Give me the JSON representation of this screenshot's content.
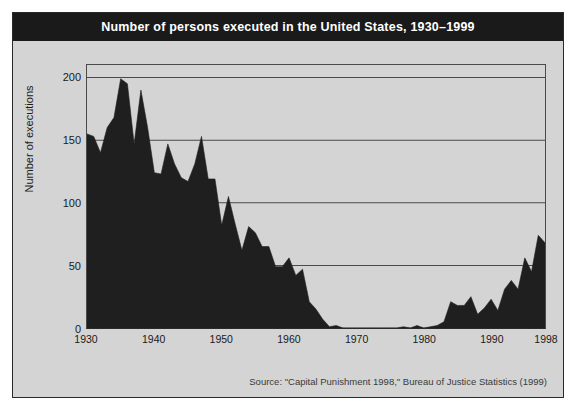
{
  "figure": {
    "title": "Number of persons executed in the United States, 1930–1999",
    "source": "Source: \"Capital Punishment 1998,\" Bureau of Justice Statistics (1999)",
    "background_color": "#d4d4d4",
    "title_bar_color": "#1a1a1a",
    "series_color": "#1f1f1f",
    "grid_color": "#4a4a4a"
  },
  "chart_data": {
    "type": "area",
    "title": "Number of persons executed in the United States, 1930–1999",
    "xlabel": "",
    "ylabel": "Number of executions",
    "xlim": [
      1930,
      1998
    ],
    "ylim": [
      0,
      210
    ],
    "yticks": [
      0,
      50,
      100,
      150,
      200
    ],
    "xticks": [
      1930,
      1940,
      1950,
      1960,
      1970,
      1980,
      1990,
      1998
    ],
    "grid": "horizontal",
    "legend": "none",
    "x": [
      1930,
      1931,
      1932,
      1933,
      1934,
      1935,
      1936,
      1937,
      1938,
      1939,
      1940,
      1941,
      1942,
      1943,
      1944,
      1945,
      1946,
      1947,
      1948,
      1949,
      1950,
      1951,
      1952,
      1953,
      1954,
      1955,
      1956,
      1957,
      1958,
      1959,
      1960,
      1961,
      1962,
      1963,
      1964,
      1965,
      1966,
      1967,
      1968,
      1969,
      1970,
      1971,
      1972,
      1973,
      1974,
      1975,
      1976,
      1977,
      1978,
      1979,
      1980,
      1981,
      1982,
      1983,
      1984,
      1985,
      1986,
      1987,
      1988,
      1989,
      1990,
      1991,
      1992,
      1993,
      1994,
      1995,
      1996,
      1997,
      1998
    ],
    "values": [
      155,
      153,
      140,
      160,
      168,
      199,
      195,
      147,
      190,
      160,
      124,
      123,
      147,
      131,
      120,
      117,
      131,
      153,
      119,
      119,
      82,
      105,
      83,
      62,
      81,
      76,
      65,
      65,
      49,
      49,
      56,
      42,
      47,
      21,
      15,
      7,
      1,
      2,
      0,
      0,
      0,
      0,
      0,
      0,
      0,
      0,
      0,
      1,
      0,
      2,
      0,
      1,
      2,
      5,
      21,
      18,
      18,
      25,
      11,
      16,
      23,
      14,
      31,
      38,
      31,
      56,
      45,
      74,
      68
    ],
    "series": [
      {
        "name": "Executions",
        "color": "#1f1f1f",
        "values": [
          155,
          153,
          140,
          160,
          168,
          199,
          195,
          147,
          190,
          160,
          124,
          123,
          147,
          131,
          120,
          117,
          131,
          153,
          119,
          119,
          82,
          105,
          83,
          62,
          81,
          76,
          65,
          65,
          49,
          49,
          56,
          42,
          47,
          21,
          15,
          7,
          1,
          2,
          0,
          0,
          0,
          0,
          0,
          0,
          0,
          0,
          0,
          1,
          0,
          2,
          0,
          1,
          2,
          5,
          21,
          18,
          18,
          25,
          11,
          16,
          23,
          14,
          31,
          38,
          31,
          56,
          45,
          74,
          68
        ]
      }
    ]
  },
  "axes": {
    "y_tick_labels": [
      "200",
      "150",
      "100",
      "50",
      "0"
    ],
    "y_tick_values": [
      200,
      150,
      100,
      50,
      0
    ],
    "x_tick_labels": [
      "1930",
      "1940",
      "1950",
      "1960",
      "1970",
      "1980",
      "1990",
      "1998"
    ],
    "x_tick_values": [
      1930,
      1940,
      1950,
      1960,
      1970,
      1980,
      1990,
      1998
    ],
    "y_axis_title": "Number of executions"
  }
}
